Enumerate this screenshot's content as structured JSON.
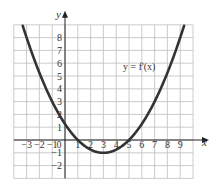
{
  "chart_data": {
    "type": "line",
    "title": "",
    "xlabel": "x",
    "ylabel": "y",
    "xlim": [
      -4,
      10
    ],
    "ylim": [
      -3,
      9
    ],
    "grid": true,
    "x_ticks": [
      "-3",
      "-2",
      "-1",
      "0",
      "1",
      "2",
      "3",
      "4",
      "5",
      "6",
      "7",
      "8",
      "9"
    ],
    "y_ticks": [
      "8",
      "7",
      "6",
      "5",
      "4",
      "3",
      "2",
      "1",
      "-1",
      "-2"
    ],
    "series": [
      {
        "name": "y = f'(x)",
        "equation": "y = 0.25(x-1)(x-5)",
        "x": [
          -3.3,
          -3,
          -2,
          -1,
          0,
          1,
          2,
          3,
          4,
          5,
          6,
          7,
          8,
          9,
          9.3
        ],
        "values": [
          9,
          8,
          5.25,
          3,
          1.25,
          0,
          -0.75,
          -1,
          -0.75,
          0,
          1.25,
          3,
          5.25,
          8,
          9
        ]
      }
    ],
    "annotations": [
      {
        "text": "y = f'(x)",
        "x": 6.5,
        "y": 6
      }
    ]
  },
  "labels": {
    "x_axis": "x",
    "y_axis": "y",
    "function": "y = f'(x)"
  },
  "colors": {
    "curve": "#333333",
    "grid": "#bfbfbf",
    "axis": "#222222"
  }
}
